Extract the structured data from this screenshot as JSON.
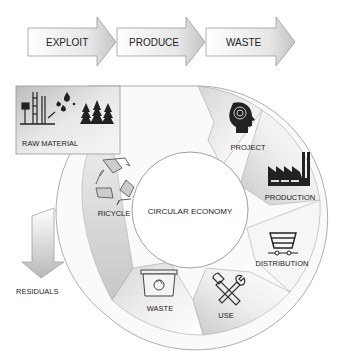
{
  "process_arrows": [
    {
      "label": "EXPLOIT"
    },
    {
      "label": "PRODUCE"
    },
    {
      "label": "WASTE"
    }
  ],
  "raw_material": {
    "label": "RAW MATERIAL",
    "icons": [
      "oil-derrick-icon",
      "oil-drops-icon",
      "pine-trees-icon"
    ]
  },
  "center": {
    "label": "CIRCULAR ECONOMY"
  },
  "segments": [
    {
      "label": "PROJECT",
      "icon": "head-spiral-icon"
    },
    {
      "label": "PRODUCTION",
      "icon": "factory-icon"
    },
    {
      "label": "DISTRIBUTION",
      "icon": "cart-icon"
    },
    {
      "label": "USE",
      "icon": "tools-icon"
    },
    {
      "label": "WASTE",
      "icon": "recycle-bin-icon"
    },
    {
      "label": "RICYCLE",
      "icon": "recycle-icon"
    }
  ],
  "residuals": {
    "label": "RESIDUALS"
  },
  "colors": {
    "band_light": "#f4f4f4",
    "band_dark": "#c8c8c8",
    "stroke": "#888888",
    "icon": "#222222"
  }
}
